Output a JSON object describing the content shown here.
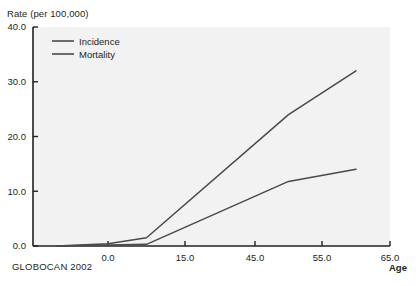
{
  "figure": {
    "source_note": "GLOBOCAN 2002",
    "y_axis_title": "Rate (per 100,000)",
    "x_axis_title": "Age"
  },
  "chart_data": {
    "type": "line",
    "title": "",
    "subtitle": "",
    "ylabel": "Rate (per 100,000)",
    "xlabel": "Age",
    "ylim": [
      0.0,
      40.0
    ],
    "xlim": [
      -10.0,
      65.0
    ],
    "grid": false,
    "legend_position": "top-left",
    "y_ticks": [
      0.0,
      10.0,
      20.0,
      30.0,
      40.0
    ],
    "y_tick_labels": [
      "0.0",
      "10.0",
      "20.0",
      "30.0",
      "40.0"
    ],
    "x_ticks": [
      0.0,
      15.0,
      45.0,
      55.0,
      65.0
    ],
    "x_tick_labels": [
      "0.0",
      "15.0",
      "45.0",
      "55.0",
      "65.0"
    ],
    "series": [
      {
        "name": "Incidence",
        "color": "#4a4a4a",
        "x": [
          -10.0,
          0.0,
          7.5,
          50.0,
          60.0
        ],
        "y": [
          0.0,
          0.4,
          1.5,
          24.0,
          32.0
        ]
      },
      {
        "name": "Mortality",
        "color": "#4a4a4a",
        "x": [
          -10.0,
          0.0,
          7.5,
          50.0,
          60.0
        ],
        "y": [
          0.0,
          0.2,
          0.3,
          11.8,
          14.0
        ]
      }
    ],
    "annotations": [
      "GLOBOCAN 2002"
    ]
  },
  "legend": {
    "entries": [
      {
        "label": "Incidence"
      },
      {
        "label": "Mortality"
      }
    ]
  },
  "colors": {
    "plot_background": "#f2f2f2",
    "axis": "#231f20",
    "line": "#4a4a4a",
    "page_background": "#ffffff"
  }
}
